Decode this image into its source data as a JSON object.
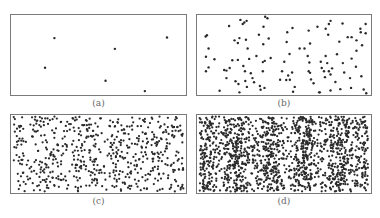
{
  "figure": {
    "dot_color": "#2a2a2a",
    "border_color": "#7a7a7a",
    "caption_color": "#666666"
  },
  "panels": [
    {
      "id": "a",
      "caption": "(a)",
      "box": [
        10,
        14,
        177,
        82
      ],
      "dot_count": 6
    },
    {
      "id": "b",
      "caption": "(b)",
      "box": [
        196,
        14,
        176,
        82
      ],
      "dot_count": 130
    },
    {
      "id": "c",
      "caption": "(c)",
      "box": [
        10,
        114,
        177,
        80
      ],
      "dot_count": 600
    },
    {
      "id": "d",
      "caption": "(d)",
      "box": [
        196,
        114,
        176,
        80
      ],
      "dot_count": 1500
    }
  ],
  "chart_data": [
    {
      "type": "scatter",
      "title": "(a)",
      "xlabel": "",
      "ylabel": "",
      "grid": false,
      "points": [
        [
          53.3,
          37.7
        ],
        [
          115.3,
          48.7
        ],
        [
          168.7,
          37.0
        ],
        [
          43.7,
          68.0
        ],
        [
          105.7,
          81.3
        ],
        [
          146.0,
          92.0
        ]
      ],
      "coord_space": "image pixels"
    },
    {
      "type": "scatter",
      "title": "(b)",
      "xlabel": "",
      "ylabel": "",
      "grid": false,
      "coord_space": "image pixels",
      "points": [
        [
          239.3,
          19
        ],
        [
          241.7,
          23.3
        ],
        [
          243.3,
          21.7
        ],
        [
          245.7,
          20
        ],
        [
          264.7,
          15.7
        ],
        [
          267,
          17.3
        ],
        [
          227.7,
          25.3
        ],
        [
          263,
          26
        ],
        [
          205,
          34.7
        ],
        [
          203.7,
          36
        ],
        [
          233.3,
          40
        ],
        [
          236.7,
          42.7
        ],
        [
          238.3,
          37.7
        ],
        [
          245,
          39.3
        ],
        [
          258.3,
          34.3
        ],
        [
          268.3,
          38
        ],
        [
          262.7,
          44
        ],
        [
          206.7,
          48.3
        ],
        [
          246.7,
          48.3
        ],
        [
          204,
          56.7
        ],
        [
          212.7,
          59.3
        ],
        [
          231,
          60.3
        ],
        [
          236.7,
          60
        ],
        [
          248.3,
          59
        ],
        [
          255.7,
          56
        ],
        [
          262.3,
          62.3
        ],
        [
          264.3,
          61
        ],
        [
          270.3,
          58
        ],
        [
          206.7,
          67.7
        ],
        [
          204,
          71.7
        ],
        [
          222.7,
          70.3
        ],
        [
          225,
          71
        ],
        [
          228.3,
          68.3
        ],
        [
          242.3,
          66.3
        ],
        [
          244,
          71.7
        ],
        [
          250,
          73.7
        ],
        [
          262.3,
          71.7
        ],
        [
          225,
          78.7
        ],
        [
          234.3,
          82
        ],
        [
          237.3,
          84.7
        ],
        [
          244.3,
          81.7
        ],
        [
          246,
          87.7
        ],
        [
          251.7,
          78.7
        ],
        [
          253.3,
          83
        ],
        [
          259.3,
          86.7
        ],
        [
          260,
          90.7
        ],
        [
          264,
          88.7
        ],
        [
          218,
          91.7
        ],
        [
          238.3,
          93.3
        ],
        [
          280,
          80.3
        ],
        [
          282,
          71.7
        ],
        [
          284.3,
          62
        ],
        [
          289.7,
          54
        ],
        [
          286.7,
          41.7
        ],
        [
          287.3,
          31.7
        ],
        [
          292.7,
          27.3
        ],
        [
          286.3,
          80.7
        ],
        [
          288.3,
          76
        ],
        [
          290,
          80.3
        ],
        [
          292.3,
          73
        ],
        [
          295,
          87.7
        ],
        [
          293.3,
          92.7
        ],
        [
          300,
          48.3
        ],
        [
          305,
          48.3
        ],
        [
          309.3,
          30
        ],
        [
          310.7,
          43.3
        ],
        [
          308.3,
          56
        ],
        [
          310,
          62.7
        ],
        [
          309.3,
          71.7
        ],
        [
          310.7,
          73.3
        ],
        [
          311.7,
          80
        ],
        [
          314.3,
          84
        ],
        [
          318.3,
          26
        ],
        [
          320.7,
          93.3
        ],
        [
          321.7,
          62
        ],
        [
          322.7,
          68.3
        ],
        [
          325,
          71.7
        ],
        [
          326,
          77.7
        ],
        [
          326.7,
          56
        ],
        [
          326.7,
          28
        ],
        [
          329.3,
          34.3
        ],
        [
          330,
          23.3
        ],
        [
          331.7,
          20
        ],
        [
          328.3,
          63.3
        ],
        [
          330,
          71.7
        ],
        [
          333.3,
          68.7
        ],
        [
          331.7,
          75
        ],
        [
          336.7,
          82.7
        ],
        [
          338.3,
          54.3
        ],
        [
          340.7,
          41.3
        ],
        [
          341.7,
          90
        ],
        [
          344,
          22.7
        ],
        [
          344.3,
          63.3
        ],
        [
          345.7,
          73
        ],
        [
          349.3,
          36.7
        ],
        [
          353.3,
          36.7
        ],
        [
          353.3,
          58.7
        ],
        [
          351.7,
          78.7
        ],
        [
          352.7,
          88.7
        ],
        [
          331.7,
          91.3
        ],
        [
          357.7,
          67
        ],
        [
          358.3,
          50.7
        ],
        [
          358.3,
          40
        ],
        [
          362.3,
          28
        ],
        [
          363.3,
          76.7
        ],
        [
          364,
          45
        ],
        [
          362.7,
          31.7
        ],
        [
          367.7,
          23.3
        ],
        [
          367.7,
          32.7
        ],
        [
          365.7,
          90.3
        ],
        [
          368.3,
          94.3
        ],
        [
          320,
          93.3
        ]
      ]
    },
    {
      "type": "scatter",
      "title": "(c)",
      "xlabel": "",
      "ylabel": "",
      "grid": false,
      "approx_point_count": 600,
      "distribution": "roughly uniform random with faint vertical banding",
      "bands": {
        "count": 5,
        "strength": 0.25
      },
      "seed": 7
    },
    {
      "type": "scatter",
      "title": "(d)",
      "xlabel": "",
      "ylabel": "",
      "grid": false,
      "approx_point_count": 1500,
      "distribution": "dense random with 5 pronounced vertical stripes of higher density",
      "bands": {
        "count": 5,
        "strength": 0.65
      },
      "seed": 13
    }
  ]
}
